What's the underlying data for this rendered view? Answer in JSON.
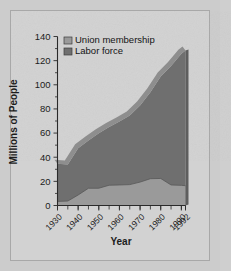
{
  "chart_data": {
    "type": "area",
    "title": "",
    "subtitle": "",
    "xlabel": "Year",
    "ylabel": "Millions of People",
    "stacked": true,
    "grid": false,
    "legend_position": "top-left",
    "xlim": [
      1930,
      1992
    ],
    "ylim": [
      0,
      140
    ],
    "yticks": [
      0,
      20,
      40,
      60,
      80,
      100,
      120,
      140
    ],
    "ytick_labels": [
      "0",
      "20",
      "40",
      "60",
      "80",
      "100",
      "120",
      "140"
    ],
    "xticks": [
      1930,
      1940,
      1950,
      1960,
      1970,
      1980,
      1990,
      1992
    ],
    "xtick_labels": [
      "1930",
      "1940",
      "1950",
      "1960",
      "1970",
      "1980",
      "1990",
      "1992"
    ],
    "x_minor_tick_step": 5,
    "x": [
      1930,
      1935,
      1940,
      1945,
      1950,
      1955,
      1960,
      1965,
      1970,
      1975,
      1980,
      1985,
      1990,
      1992
    ],
    "series": [
      {
        "name": "Union membership",
        "color": "#9a9a9a",
        "values": [
          3.4,
          3.7,
          8.7,
          14.3,
          14.3,
          16.8,
          17.0,
          17.3,
          19.4,
          22.2,
          22.4,
          17.0,
          16.7,
          16.4
        ]
      },
      {
        "name": "Labor force",
        "color": "#6f6f6f",
        "values": [
          34.5,
          34.0,
          47.5,
          53.9,
          59.8,
          65.0,
          69.6,
          74.5,
          82.8,
          93.8,
          106.9,
          115.5,
          125.8,
          128.5
        ]
      }
    ],
    "legend": [
      {
        "label": "Union membership",
        "color": "#9a9a9a"
      },
      {
        "label": "Labor force",
        "color": "#6f6f6f"
      }
    ],
    "annotations": []
  },
  "colors": {
    "page_background": "#cccccc",
    "paper": "#d2d2d2",
    "axis": "#2a2a2a",
    "union_fill": "#9a9a9a",
    "labor_fill": "#6f6f6f",
    "bevel_top": "#8a8a8a",
    "bevel_right": "#5e5e5e"
  }
}
